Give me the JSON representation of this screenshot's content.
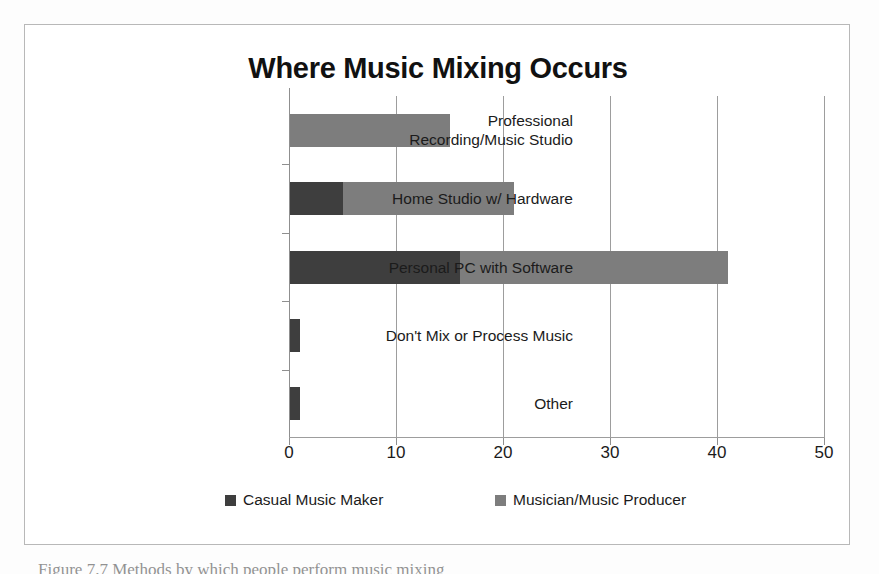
{
  "figure": {
    "title": "Where Music Mixing Occurs",
    "caption": "Figure 7.7 Methods by which people perform music mixing"
  },
  "axis": {
    "x_ticks": [
      "0",
      "10",
      "20",
      "30",
      "40",
      "50"
    ]
  },
  "legend": {
    "items": [
      {
        "label": "Casual Music Maker",
        "color": "#3e3e3e"
      },
      {
        "label": "Musician/Music Producer",
        "color": "#7d7d7d"
      }
    ]
  },
  "chart_data": {
    "type": "bar",
    "orientation": "horizontal",
    "stacked": true,
    "title": "Where Music Mixing Occurs",
    "xlabel": "",
    "ylabel": "",
    "xlim": [
      0,
      50
    ],
    "xticks": [
      0,
      10,
      20,
      30,
      40,
      50
    ],
    "grid": true,
    "legend_position": "bottom",
    "categories": [
      "Professional\nRecording/Music Studio",
      "Home Studio w/ Hardware",
      "Personal PC with Software",
      "Don't Mix or Process Music",
      "Other"
    ],
    "series": [
      {
        "name": "Casual Music Maker",
        "color": "#3e3e3e",
        "values": [
          0,
          5,
          16,
          1,
          1
        ]
      },
      {
        "name": "Musician/Music Producer",
        "color": "#7d7d7d",
        "values": [
          15,
          16,
          25,
          0,
          0
        ]
      }
    ],
    "totals": [
      15,
      21,
      41,
      1,
      1
    ]
  }
}
